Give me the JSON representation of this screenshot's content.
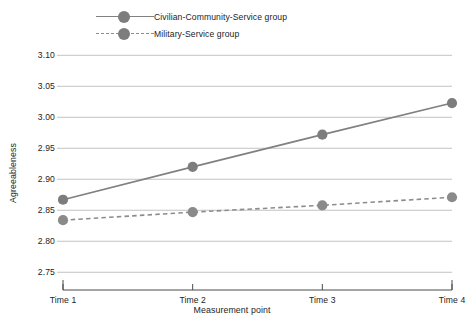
{
  "chart_data": {
    "type": "line",
    "title": "",
    "xlabel": "Measurement point",
    "ylabel": "Agreeableness",
    "categories": [
      "Time 1",
      "Time 2",
      "Time 3",
      "Time 4"
    ],
    "ylim": [
      2.7375,
      3.115
    ],
    "yticks": [
      2.75,
      2.8,
      2.85,
      2.9,
      2.95,
      3.0,
      3.05,
      3.1
    ],
    "ytick_labels": [
      "2.75",
      "2.80",
      "2.85",
      "2.90",
      "2.95",
      "3.00",
      "3.05",
      "3.10"
    ],
    "grid": "horizontal",
    "legend_position": "top-left-outside",
    "series": [
      {
        "name": "Civilian-Community-Service group",
        "values": [
          2.867,
          2.92,
          2.972,
          3.023
        ],
        "line_style": "solid",
        "color": "#808080",
        "marker": "circle",
        "marker_color": "#7d7d7d"
      },
      {
        "name": "Military-Service group",
        "values": [
          2.834,
          2.847,
          2.858,
          2.871
        ],
        "line_style": "dashed",
        "color": "#8c8c8c",
        "marker": "circle",
        "marker_color": "#8a8a8a"
      }
    ]
  },
  "legend": {
    "items": [
      {
        "label": "Civilian-Community-Service group",
        "style": "solid"
      },
      {
        "label": "Military-Service group",
        "style": "dashed"
      }
    ]
  },
  "colors": {
    "background": "#ffffff",
    "gridline": "#b4b4b4",
    "axis": "#4a4a4a",
    "text": "#232323",
    "series_1": "#808080",
    "series_2": "#8c8c8c"
  }
}
